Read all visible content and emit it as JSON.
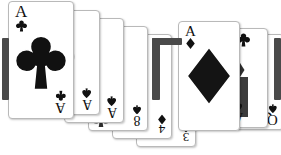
{
  "scene": {
    "background_color": "#ffffff",
    "description": "Two overlapping fans of playing cards on a white background",
    "ink_color": "#111111",
    "card_face_color": "#ffffff",
    "card_border_color": "#b9b9b9",
    "edge_shadow_color": "#4a4a4a"
  },
  "left_fan": {
    "name": "left-card-fan",
    "cards": [
      {
        "id": "ace-of-clubs",
        "rank": "A",
        "suit": "clubs",
        "suit_symbol": "♣",
        "visible_index": "A♣",
        "orientation": "upright"
      },
      {
        "id": "ace-of-spades-back",
        "rank": "A",
        "suit": "spades",
        "suit_symbol": "♠",
        "visible_index": "A♠",
        "orientation": "inverted"
      },
      {
        "id": "ace-of-spades-front",
        "rank": "A",
        "suit": "spades",
        "suit_symbol": "♠",
        "visible_index": "A♠",
        "orientation": "inverted"
      },
      {
        "id": "eight-of-spades",
        "rank": "8",
        "suit": "spades",
        "suit_symbol": "♠",
        "visible_index": "8♠",
        "orientation": "inverted"
      },
      {
        "id": "four-of-diamonds",
        "rank": "4",
        "suit": "diamonds",
        "suit_symbol": "♦",
        "visible_index": "4♦",
        "orientation": "inverted"
      },
      {
        "id": "three-of-spades",
        "rank": "3",
        "suit": "spades",
        "suit_symbol": "♠",
        "visible_index": "3♠",
        "orientation": "inverted"
      }
    ]
  },
  "right_fan": {
    "name": "right-card-fan",
    "cards": [
      {
        "id": "ace-of-diamonds",
        "rank": "A",
        "suit": "diamonds",
        "suit_symbol": "♦",
        "visible_index": "A♦",
        "orientation": "upright"
      },
      {
        "id": "ace-of-spades-right",
        "rank": "A",
        "suit": "spades",
        "suit_symbol": "♠",
        "visible_index": "A♠",
        "orientation": "inverted"
      },
      {
        "id": "queen-of-spades",
        "rank": "Q",
        "suit": "spades",
        "suit_symbol": "♠",
        "visible_index": "Q♠",
        "orientation": "inverted"
      }
    ]
  },
  "captions": {
    "left": "",
    "right": ""
  }
}
